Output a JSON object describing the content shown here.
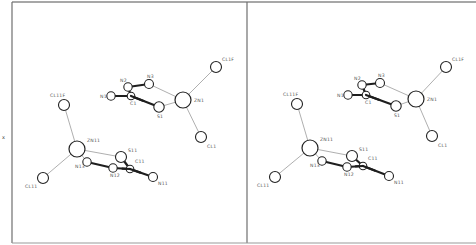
{
  "figure": {
    "side_mark": "x",
    "views": [
      {
        "name": "left-view"
      },
      {
        "name": "right-view"
      }
    ]
  },
  "atoms": {
    "labels": {
      "N1": "N1",
      "C1": "C1",
      "N2": "N2",
      "N3": "N3",
      "S1": "S1",
      "ZN1": "ZN1",
      "CL1F": "CL1F",
      "CL1": "CL1",
      "N11": "N11",
      "C11": "C11",
      "N12": "N12",
      "N13": "N13",
      "S11": "S11",
      "ZN11": "ZN11",
      "CL11F": "CL11F",
      "CL11": "CL11"
    },
    "element_colors": {
      "outline": "#222222",
      "thin_bond": "#9a9a9a",
      "thick_bond": "#1e1e1e"
    }
  },
  "bonds": {
    "thick": [
      [
        "N1",
        "C1"
      ],
      [
        "C1",
        "N2"
      ],
      [
        "N2",
        "N3"
      ],
      [
        "C1",
        "S1"
      ],
      [
        "N11",
        "C11"
      ],
      [
        "C11",
        "N12"
      ],
      [
        "N12",
        "N13"
      ],
      [
        "C11",
        "S11"
      ]
    ],
    "thin": [
      [
        "N3",
        "ZN1"
      ],
      [
        "S1",
        "ZN1"
      ],
      [
        "ZN1",
        "CL1F"
      ],
      [
        "ZN1",
        "CL1"
      ],
      [
        "N13",
        "ZN11"
      ],
      [
        "S11",
        "ZN11"
      ],
      [
        "ZN11",
        "CL11F"
      ],
      [
        "ZN11",
        "CL11"
      ]
    ]
  }
}
